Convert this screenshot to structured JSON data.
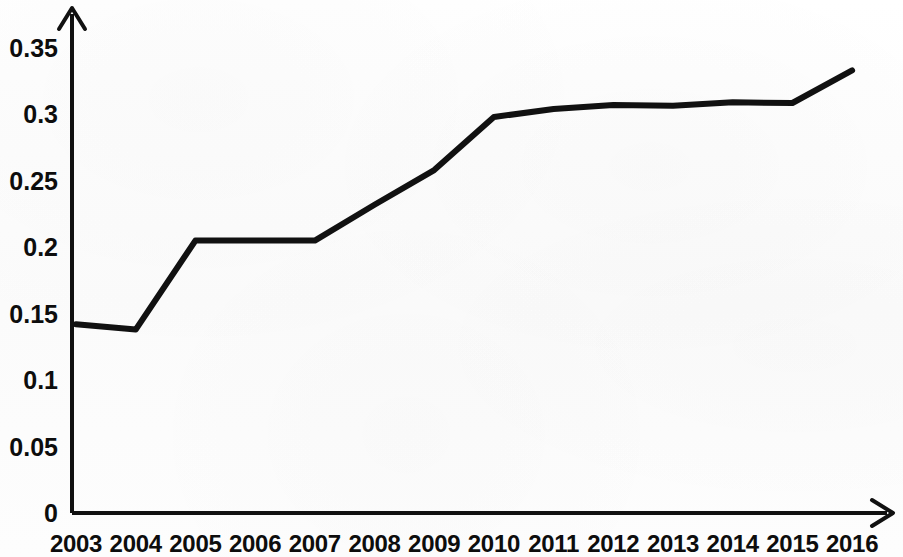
{
  "chart_data": {
    "type": "line",
    "title": "",
    "subtitle": "",
    "xlabel": "",
    "ylabel": "",
    "categories": [
      "2003",
      "2004",
      "2005",
      "2006",
      "2007",
      "2008",
      "2009",
      "2010",
      "2011",
      "2012",
      "2013",
      "2014",
      "2015",
      "2016"
    ],
    "values": [
      0.142,
      0.138,
      0.205,
      0.205,
      0.205,
      0.232,
      0.258,
      0.298,
      0.304,
      0.307,
      0.3065,
      0.309,
      0.3085,
      0.333
    ],
    "series": [
      {
        "name": "",
        "values": [
          0.142,
          0.138,
          0.205,
          0.205,
          0.205,
          0.232,
          0.258,
          0.298,
          0.304,
          0.307,
          0.3065,
          0.309,
          0.3085,
          0.333
        ]
      }
    ],
    "x_tick_labels": [
      "2003",
      "2004",
      "2005",
      "2006",
      "2007",
      "2008",
      "2009",
      "2010",
      "2011",
      "2012",
      "2013",
      "2014",
      "2015",
      "2016"
    ],
    "y_tick_labels": [
      "0",
      "0.05",
      "0.1",
      "0.15",
      "0.2",
      "0.25",
      "0.3",
      "0.35"
    ],
    "y_tick_values": [
      0,
      0.05,
      0.1,
      0.15,
      0.2,
      0.25,
      0.3,
      0.35
    ],
    "ylim": [
      0,
      0.3625
    ],
    "xlim": [
      "2003",
      "2016"
    ],
    "grid": false,
    "legend": false,
    "legend_position": "none",
    "annotations": [],
    "line_color": "#111111",
    "axis_color": "#111111",
    "background_color": "#fdfdfd",
    "line_width": 6,
    "markers": false,
    "axis_style": "arrow-ended-l-shape"
  },
  "geometry": {
    "x_axis_y": 513,
    "y_axis_x": 72,
    "x_first": 76,
    "x_step": 59.7,
    "y_zero": 513,
    "px_per_unit": 1329,
    "y_arrow_tip_y": 8,
    "x_arrow_tip_x": 893
  }
}
